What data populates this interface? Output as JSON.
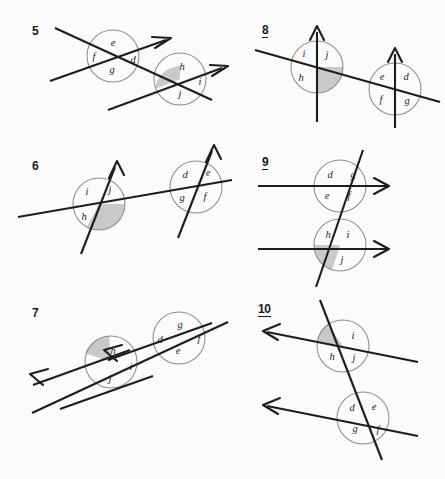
{
  "page": {
    "background_color": "#fbfbfb",
    "ink_color": "#1d1d1d",
    "circle_color": "#8d8d8d",
    "shade_color": "#c9c9c9"
  },
  "problems": [
    {
      "number": "5",
      "underlined": false,
      "description": "two parallel lines with arrowheads cut by a transversal, two labelled intersections",
      "intersections": [
        {
          "name": "left-intersection",
          "labels": [
            {
              "text": "e",
              "position": "top"
            },
            {
              "text": "f",
              "position": "left"
            },
            {
              "text": "d",
              "position": "right"
            },
            {
              "text": "g",
              "position": "bottom"
            }
          ],
          "shaded": false
        },
        {
          "name": "right-intersection",
          "labels": [
            {
              "text": "h",
              "position": "top"
            },
            {
              "text": "i",
              "position": "right"
            },
            {
              "text": "j",
              "position": "bottom"
            }
          ],
          "shaded": true,
          "shaded_side": "left"
        }
      ]
    },
    {
      "number": "6",
      "underlined": false,
      "description": "two parallel slanted arrows cut by a near-horizontal transversal",
      "intersections": [
        {
          "name": "left-intersection",
          "labels": [
            {
              "text": "i",
              "position": "top-left"
            },
            {
              "text": "j",
              "position": "top-right"
            },
            {
              "text": "h",
              "position": "bottom-left"
            }
          ],
          "shaded": true,
          "shaded_side": "bottom-right"
        },
        {
          "name": "right-intersection",
          "labels": [
            {
              "text": "d",
              "position": "top-left"
            },
            {
              "text": "e",
              "position": "top-right"
            },
            {
              "text": "g",
              "position": "bottom-left"
            },
            {
              "text": "f",
              "position": "bottom-right"
            }
          ],
          "shaded": false
        }
      ]
    },
    {
      "number": "7",
      "underlined": false,
      "description": "two parallel arrows pointing up-left cut by a transversal",
      "intersections": [
        {
          "name": "left-intersection",
          "labels": [
            {
              "text": "h",
              "position": "top"
            },
            {
              "text": "i",
              "position": "right"
            },
            {
              "text": "j",
              "position": "bottom"
            }
          ],
          "shaded": true,
          "shaded_side": "left"
        },
        {
          "name": "right-intersection",
          "labels": [
            {
              "text": "g",
              "position": "top"
            },
            {
              "text": "d",
              "position": "left"
            },
            {
              "text": "f",
              "position": "right"
            },
            {
              "text": "e",
              "position": "bottom"
            }
          ],
          "shaded": false
        }
      ]
    },
    {
      "number": "8",
      "underlined": true,
      "description": "two vertical arrows cut by a slanted transversal",
      "intersections": [
        {
          "name": "left-intersection",
          "labels": [
            {
              "text": "i",
              "position": "top-left"
            },
            {
              "text": "j",
              "position": "top-right"
            },
            {
              "text": "h",
              "position": "bottom-left"
            }
          ],
          "shaded": true,
          "shaded_side": "bottom-right"
        },
        {
          "name": "right-intersection",
          "labels": [
            {
              "text": "e",
              "position": "top-left"
            },
            {
              "text": "d",
              "position": "top-right"
            },
            {
              "text": "f",
              "position": "bottom-left"
            },
            {
              "text": "g",
              "position": "bottom-right"
            }
          ],
          "shaded": false
        }
      ]
    },
    {
      "number": "9",
      "underlined": true,
      "description": "two horizontal arrows cut by a steep transversal",
      "intersections": [
        {
          "name": "top-intersection",
          "labels": [
            {
              "text": "d",
              "position": "top-left"
            },
            {
              "text": "g",
              "position": "top-right"
            },
            {
              "text": "e",
              "position": "bottom-left"
            },
            {
              "text": "f",
              "position": "bottom-right"
            }
          ],
          "shaded": false
        },
        {
          "name": "bottom-intersection",
          "labels": [
            {
              "text": "h",
              "position": "top-left"
            },
            {
              "text": "i",
              "position": "top-right"
            },
            {
              "text": "j",
              "position": "bottom"
            }
          ],
          "shaded": true,
          "shaded_side": "bottom-left"
        }
      ]
    },
    {
      "number": "10",
      "underlined": true,
      "description": "two arrows pointing left cut by a steep transversal",
      "intersections": [
        {
          "name": "top-intersection",
          "labels": [
            {
              "text": "i",
              "position": "top-right"
            },
            {
              "text": "h",
              "position": "bottom-left"
            },
            {
              "text": "j",
              "position": "bottom-right"
            }
          ],
          "shaded": true,
          "shaded_side": "top-left"
        },
        {
          "name": "bottom-intersection",
          "labels": [
            {
              "text": "d",
              "position": "top-left"
            },
            {
              "text": "e",
              "position": "top-right"
            },
            {
              "text": "g",
              "position": "bottom-left"
            },
            {
              "text": "f",
              "position": "bottom-right"
            }
          ],
          "shaded": false
        }
      ]
    }
  ]
}
